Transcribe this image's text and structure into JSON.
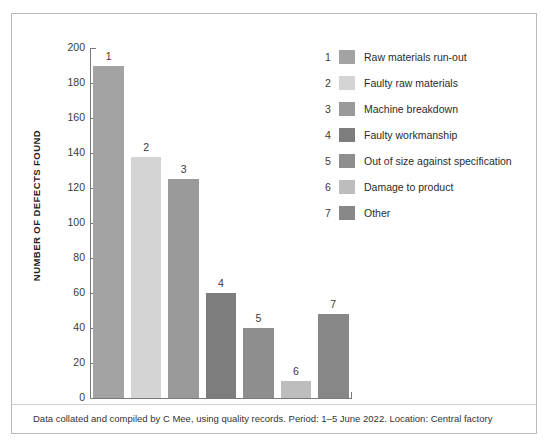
{
  "chart_data": {
    "type": "bar",
    "title": "",
    "xlabel": "",
    "ylabel": "NUMBER OF DEFECTS FOUND",
    "ylim": [
      0,
      200
    ],
    "ytick_step": 20,
    "yticks": [
      "200",
      "180",
      "160",
      "140",
      "120",
      "100",
      "80",
      "60",
      "40",
      "20",
      "0"
    ],
    "grid": false,
    "legend_position": "right",
    "categories": [
      "1",
      "2",
      "3",
      "4",
      "5",
      "6",
      "7"
    ],
    "values": [
      190,
      138,
      125,
      60,
      40,
      10,
      48
    ],
    "bar_labels": [
      "1",
      "2",
      "3",
      "4",
      "5",
      "6",
      "7"
    ],
    "series_name": "Number of defects found",
    "colors": [
      "#a3a3a3",
      "#d4d4d4",
      "#9a9a9a",
      "#7d7d7d",
      "#8e8e8e",
      "#bdbdbd",
      "#878787"
    ],
    "legend": [
      {
        "number": "1",
        "label": "Raw materials run-out",
        "color": "#a3a3a3",
        "value": 190
      },
      {
        "number": "2",
        "label": "Faulty raw materials",
        "color": "#d4d4d4",
        "value": 138
      },
      {
        "number": "3",
        "label": "Machine breakdown",
        "color": "#9a9a9a",
        "value": 125
      },
      {
        "number": "4",
        "label": "Faulty workmanship",
        "color": "#7d7d7d",
        "value": 60
      },
      {
        "number": "5",
        "label": "Out of size against specification",
        "color": "#8e8e8e",
        "value": 40
      },
      {
        "number": "6",
        "label": "Damage to product",
        "color": "#bdbdbd",
        "value": 10
      },
      {
        "number": "7",
        "label": "Other",
        "color": "#878787",
        "value": 48
      }
    ],
    "caption": "Data collated and compiled by C Mee, using quality records. Period: 1–5 June 2022. Location: Central factory"
  }
}
